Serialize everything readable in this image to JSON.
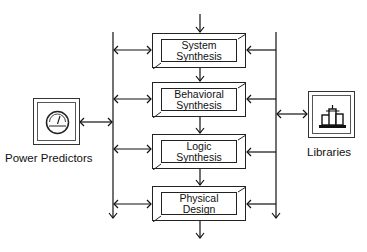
{
  "diagram": {
    "stages": [
      {
        "line1": "System",
        "line2": "Synthesis"
      },
      {
        "line1": "Behavioral",
        "line2": "Synthesis"
      },
      {
        "line1": "Logic",
        "line2": "Synthesis"
      },
      {
        "line1": "Physical",
        "line2": "Design"
      }
    ],
    "left_tool": {
      "label": "Power Predictors",
      "icon": "gauge-icon"
    },
    "right_tool": {
      "label": "Libraries",
      "icon": "library-buildings-icon"
    },
    "caption": "Figure ... (cut off)"
  }
}
